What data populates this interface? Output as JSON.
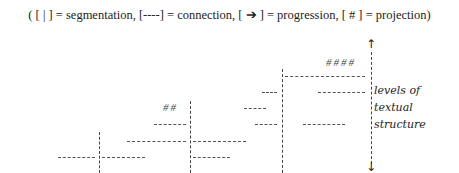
{
  "legend": {
    "text": "( [ | ] = segmentation, [----] = connection, [ ➔ ] = progression, [ # ] = projection)",
    "items": [
      {
        "symbol": "|",
        "meaning": "segmentation"
      },
      {
        "symbol": "----",
        "meaning": "connection"
      },
      {
        "symbol": "➔",
        "meaning": "progression"
      },
      {
        "symbol": "#",
        "meaning": "projection"
      }
    ]
  },
  "axis": {
    "label_lines": [
      "levels of",
      "textual",
      "structure"
    ],
    "up_arrow": "↑",
    "down_arrow": "↓"
  },
  "projections": {
    "top": "####",
    "left": "##"
  }
}
